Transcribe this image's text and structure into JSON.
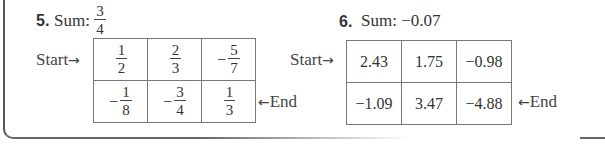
{
  "problem5": {
    "number": "5.",
    "sum_label": "Sum:",
    "sum": {
      "num": "3",
      "den": "4"
    },
    "start_label": "Start",
    "end_label": "End",
    "start_arrow": "→",
    "end_arrow": "←",
    "grid": [
      [
        {
          "sign": "",
          "num": "1",
          "den": "2"
        },
        {
          "sign": "",
          "num": "2",
          "den": "3"
        },
        {
          "sign": "−",
          "num": "5",
          "den": "7"
        }
      ],
      [
        {
          "sign": "−",
          "num": "1",
          "den": "8"
        },
        {
          "sign": "−",
          "num": "3",
          "den": "4"
        },
        {
          "sign": "",
          "num": "1",
          "den": "3"
        }
      ]
    ]
  },
  "problem6": {
    "number": "6.",
    "sum_label": "Sum:",
    "sum": "−0.07",
    "start_label": "Start",
    "end_label": "End",
    "start_arrow": "→",
    "end_arrow": "←",
    "grid": [
      [
        "2.43",
        "1.75",
        "−0.98"
      ],
      [
        "−1.09",
        "3.47",
        "−4.88"
      ]
    ]
  }
}
